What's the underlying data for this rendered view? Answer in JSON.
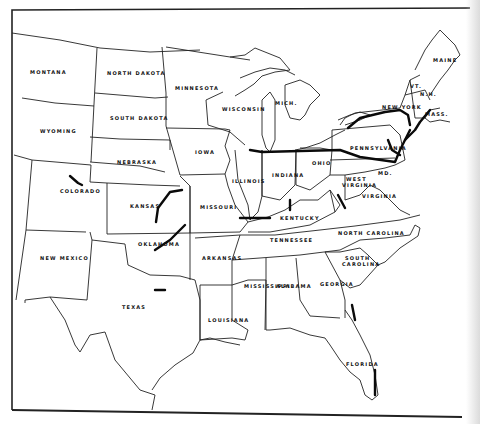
{
  "map": {
    "type": "United States railroad route map (scanned, black and white)",
    "colors": {
      "paper": "#ffffff",
      "ink": "#111111",
      "route": "#0a0a0a",
      "edge_shadow": "#d7d7d7"
    },
    "state_labels": {
      "montana": "MONTANA",
      "north_dakota": "NORTH DAKOTA",
      "south_dakota": "SOUTH DAKOTA",
      "wyoming": "WYOMING",
      "nebraska": "NEBRASKA",
      "colorado": "COLORADO",
      "kansas": "KANSAS",
      "new_mexico": "NEW MEXICO",
      "oklahoma": "OKLAHOMA",
      "texas": "TEXAS",
      "minnesota": "MINNESOTA",
      "iowa": "IOWA",
      "missouri": "MISSOURI",
      "arkansas": "ARKANSAS",
      "louisiana": "LOUISIANA",
      "wisconsin": "WISCONSIN",
      "illinois": "ILLINOIS",
      "michigan": "MICH.",
      "indiana": "INDIANA",
      "ohio": "OHIO",
      "kentucky": "KENTUCKY",
      "tennessee": "TENNESSEE",
      "mississippi": "MISSISSIPPI",
      "alabama": "ALABAMA",
      "georgia": "GEORGIA",
      "florida": "FLORIDA",
      "south_carolina_1": "SOUTH",
      "south_carolina_2": "CAROLINA",
      "north_carolina": "NORTH CAROLINA",
      "virginia": "VIRGINIA",
      "west_virginia_1": "WEST",
      "west_virginia_2": "VIRGINIA",
      "pennsylvania": "PENNSYLVANIA",
      "new_york": "NEW YORK",
      "maine": "MAINE",
      "vermont": "VT.",
      "new_hampshire": "N.H.",
      "massachusetts": "MASS.",
      "maryland": "MD."
    }
  }
}
